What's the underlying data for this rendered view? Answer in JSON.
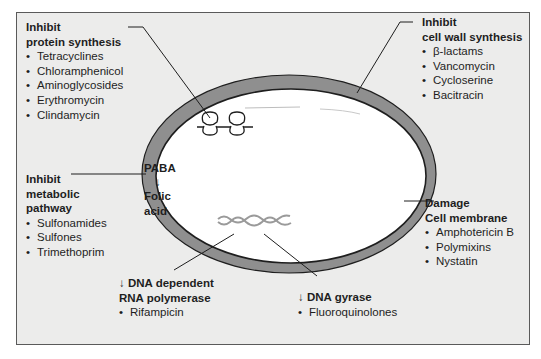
{
  "diagram": {
    "colors": {
      "panel_background": "#ececeb",
      "cell_wall": "#8f8f8f",
      "outline": "#1e1e1e",
      "dna": "#9a9a9a"
    },
    "protein_synthesis": {
      "heading_line1": "Inhibit",
      "heading_line2": "protein synthesis",
      "drugs": [
        "Tetracyclines",
        "Chloramphenicol",
        "Aminoglycosides",
        "Erythromycin",
        "Clindamycin"
      ]
    },
    "cell_wall": {
      "heading_line1": "Inhibit",
      "heading_line2": "cell wall synthesis",
      "drugs": [
        "β-lactams",
        "Vancomycin",
        "Cycloserine",
        "Bacitracin"
      ]
    },
    "metabolic": {
      "heading_line1": "Inhibit",
      "heading_line2": "metabolic",
      "heading_line3": "pathway",
      "drugs": [
        "Sulfonamides",
        "Sulfones",
        "Trimethoprim"
      ]
    },
    "membrane": {
      "heading_line1": "Damage",
      "heading_line2": "Cell membrane",
      "drugs": [
        "Amphotericin B",
        "Polymixins",
        "Nystatin"
      ]
    },
    "rna_polymerase": {
      "heading_line1": "↓ DNA dependent",
      "heading_line2": "RNA polymerase",
      "drugs": [
        "Rifampicin"
      ]
    },
    "dna_gyrase": {
      "heading_line1": "↓ DNA gyrase",
      "drugs": [
        "Fluoroquinolones"
      ]
    },
    "pathway": {
      "substrate": "PABA",
      "arrow": "↓",
      "product_line1": "Folic",
      "product_line2": "acid"
    },
    "icons": {
      "ribosome": "ribosome-icon",
      "dna": "dna-helix-icon",
      "cell": "bacterial-cell-icon"
    }
  }
}
